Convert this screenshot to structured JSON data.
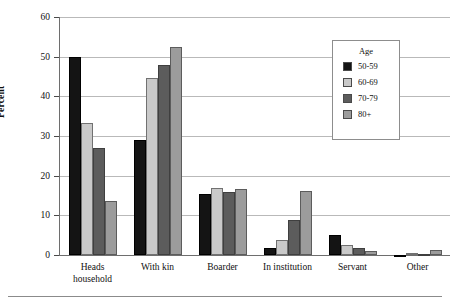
{
  "chart_data": {
    "type": "bar",
    "title": "",
    "xlabel": "",
    "ylabel": "Percent",
    "ylim": [
      0,
      60
    ],
    "yticks": [
      0,
      10,
      20,
      30,
      40,
      50,
      60
    ],
    "grid": true,
    "legend_position": "top-right",
    "legend_title": "Age",
    "categories": [
      "Heads\nhousehold",
      "With kin",
      "Boarder",
      "In institution",
      "Servant",
      "Other"
    ],
    "series": [
      {
        "name": "50-59",
        "color": "#141414",
        "values": [
          49.9,
          29.0,
          15.4,
          1.8,
          5.0,
          0.1
        ]
      },
      {
        "name": "60-69",
        "color": "#c9c9c9",
        "values": [
          33.2,
          44.7,
          16.9,
          3.8,
          2.6,
          0.4
        ]
      },
      {
        "name": "70-79",
        "color": "#5c5c5c",
        "values": [
          27.0,
          47.8,
          15.8,
          8.7,
          1.8,
          0.2
        ]
      },
      {
        "name": "80+",
        "color": "#9c9c9c",
        "values": [
          13.7,
          52.5,
          16.7,
          16.1,
          1.0,
          1.2
        ]
      }
    ]
  },
  "axes": {
    "y_title": "Percent",
    "y_tick_labels": [
      "0",
      "10",
      "20",
      "30",
      "40",
      "50",
      "60"
    ]
  },
  "legend": {
    "title": "Age",
    "items": [
      {
        "label": "50-59",
        "swatch": "legend-swatch-50-59"
      },
      {
        "label": "60-69",
        "swatch": "legend-swatch-60-69"
      },
      {
        "label": "70-79",
        "swatch": "legend-swatch-70-79"
      },
      {
        "label": "80+",
        "swatch": "legend-swatch-80-plus"
      }
    ]
  }
}
